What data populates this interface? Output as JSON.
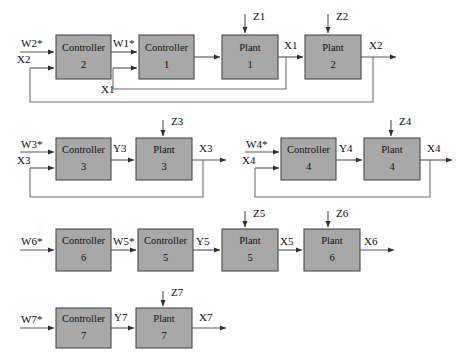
{
  "diagram": {
    "colors": {
      "block_fill": "#a8a8a8",
      "block_stroke": "#4a4a4a",
      "wire": "#585858",
      "arrow": "#2e2e2e",
      "background": "#ffffff",
      "text": "#0d0d0d"
    },
    "blocks": [
      {
        "id": "controller2",
        "line1": "Controller",
        "line2": "2",
        "x": 56,
        "y": 35,
        "w": 55,
        "h": 44
      },
      {
        "id": "controller1",
        "line1": "Controller",
        "line2": "1",
        "x": 139,
        "y": 35,
        "w": 55,
        "h": 44
      },
      {
        "id": "plant1",
        "line1": "Plant",
        "line2": "1",
        "x": 222,
        "y": 35,
        "w": 56,
        "h": 44
      },
      {
        "id": "plant2",
        "line1": "Plant",
        "line2": "2",
        "x": 305,
        "y": 35,
        "w": 56,
        "h": 44
      },
      {
        "id": "controller3",
        "line1": "Controller",
        "line2": "3",
        "x": 56,
        "y": 138,
        "w": 55,
        "h": 42
      },
      {
        "id": "plant3",
        "line1": "Plant",
        "line2": "3",
        "x": 136,
        "y": 138,
        "w": 56,
        "h": 42
      },
      {
        "id": "controller4",
        "line1": "Controller",
        "line2": "4",
        "x": 281,
        "y": 138,
        "w": 55,
        "h": 42
      },
      {
        "id": "plant4",
        "line1": "Plant",
        "line2": "4",
        "x": 364,
        "y": 138,
        "w": 56,
        "h": 42
      },
      {
        "id": "controller6",
        "line1": "Controller",
        "line2": "6",
        "x": 56,
        "y": 229,
        "w": 55,
        "h": 42
      },
      {
        "id": "controller5",
        "line1": "Controller",
        "line2": "5",
        "x": 138,
        "y": 229,
        "w": 55,
        "h": 42
      },
      {
        "id": "plant5",
        "line1": "Plant",
        "line2": "5",
        "x": 222,
        "y": 229,
        "w": 56,
        "h": 42
      },
      {
        "id": "plant6",
        "line1": "Plant",
        "line2": "6",
        "x": 304,
        "y": 229,
        "w": 56,
        "h": 42
      },
      {
        "id": "controller7",
        "line1": "Controller",
        "line2": "7",
        "x": 56,
        "y": 308,
        "w": 55,
        "h": 40
      },
      {
        "id": "plant7",
        "line1": "Plant",
        "line2": "7",
        "x": 136,
        "y": 308,
        "w": 56,
        "h": 40
      }
    ],
    "signals": {
      "row1": {
        "w2_star": "W2*",
        "x2_in": "X2",
        "w1_star": "W1*",
        "x1_feedback": "X1",
        "z1": "Z1",
        "z2": "Z2",
        "x1_out": "X1",
        "x2_out": "X2"
      },
      "row2_left": {
        "w3_star": "W3*",
        "x3_in": "X3",
        "y3": "Y3",
        "z3": "Z3",
        "x3_out": "X3"
      },
      "row2_right": {
        "w4_star": "W4*",
        "x4_in": "X4",
        "y4": "Y4",
        "z4": "Z4",
        "x4_out": "X4"
      },
      "row3": {
        "w6_star": "W6*",
        "w5_star": "W5*",
        "y5": "Y5",
        "z5": "Z5",
        "x5": "X5",
        "z6": "Z6",
        "x6": "X6"
      },
      "row4": {
        "w7_star": "W7*",
        "y7": "Y7",
        "z7": "Z7",
        "x7": "X7"
      }
    }
  }
}
